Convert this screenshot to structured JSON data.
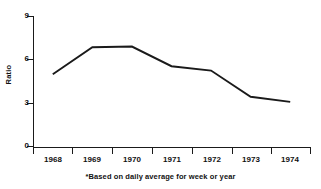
{
  "chart_data": {
    "type": "line",
    "title": "",
    "xlabel": "",
    "ylabel": "Ratio",
    "x": [
      "1968",
      "1969",
      "1970",
      "1971",
      "1972",
      "1973",
      "1974"
    ],
    "categories": [
      "1968",
      "1969",
      "1970",
      "1971",
      "1972",
      "1973",
      "1974"
    ],
    "values": [
      5.0,
      6.85,
      6.9,
      5.55,
      5.25,
      3.45,
      3.1
    ],
    "series": [
      {
        "name": "Ratio",
        "values": [
          5.0,
          6.85,
          6.9,
          5.55,
          5.25,
          3.45,
          3.1
        ]
      }
    ],
    "ylim": [
      0,
      9
    ],
    "yticks": [
      0,
      3,
      6,
      9
    ],
    "ytick_labels": [
      "0",
      "3",
      "6",
      "9"
    ],
    "xtick_labels": [
      "1968",
      "1969",
      "1970",
      "1971",
      "1972",
      "1973",
      "1974"
    ],
    "grid": false,
    "legend": false,
    "legend_position": "none",
    "line_color": "#1a1a1a",
    "background_color": "#ffffff",
    "annotations": [
      "*Based on daily average for week or year"
    ]
  },
  "footnote": "*Based on daily average for week or year"
}
